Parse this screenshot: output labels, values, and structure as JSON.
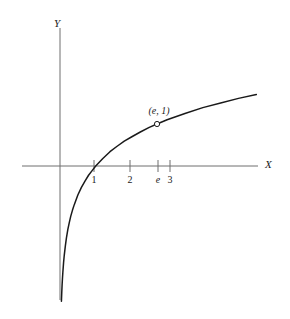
{
  "figure": {
    "background_color": "#ffffff",
    "axis_color": "#6e6e6e",
    "curve_color": "#1a1a1a",
    "text_color": "#1a1a1a"
  },
  "axes": {
    "x_axis_label": "X",
    "y_axis_label": "Y"
  },
  "annotations": {
    "point_label": "(e, 1)",
    "point_marker": "open-circle"
  },
  "ticks": {
    "x": [
      {
        "label": "1",
        "value": 1,
        "italic": false
      },
      {
        "label": "2",
        "value": 2,
        "italic": false
      },
      {
        "label": "e",
        "value": 2.71828,
        "italic": true
      },
      {
        "label": "3",
        "value": 3,
        "italic": false
      }
    ]
  },
  "chart_data": {
    "type": "line",
    "title": "",
    "subtitle": "",
    "xlabel": "X",
    "ylabel": "Y",
    "function": "y = ln(x)",
    "grid": false,
    "legend": false,
    "legend_position": "none",
    "xlim": [
      -1.07,
      5.55
    ],
    "ylim": [
      -3.3,
      2.4
    ],
    "xticks": [
      1,
      2,
      2.71828,
      3
    ],
    "xticklabels": [
      "1",
      "2",
      "e",
      "3"
    ],
    "yticks": [],
    "yticklabels": [],
    "annotations": [
      {
        "text": "(e, 1)",
        "x": 2.71828,
        "y": 1,
        "marker": "open-circle"
      }
    ],
    "series": [
      {
        "name": "y = ln(x)",
        "x": [
          0.04,
          0.05,
          0.06,
          0.07,
          0.08,
          0.1,
          0.12,
          0.15,
          0.18,
          0.22,
          0.26,
          0.3,
          0.35,
          0.4,
          0.5,
          0.6,
          0.7,
          0.8,
          0.9,
          1.0,
          1.2,
          1.4,
          1.6,
          1.8,
          2.0,
          2.25,
          2.5,
          2.71828,
          3.0,
          3.5,
          4.0,
          4.5,
          5.0,
          5.5
        ],
        "y": [
          -3.22,
          -3.0,
          -2.81,
          -2.66,
          -2.53,
          -2.3,
          -2.12,
          -1.9,
          -1.71,
          -1.51,
          -1.35,
          -1.2,
          -1.05,
          -0.92,
          -0.69,
          -0.51,
          -0.36,
          -0.22,
          -0.11,
          0.0,
          0.18,
          0.34,
          0.47,
          0.59,
          0.69,
          0.81,
          0.92,
          1.0,
          1.1,
          1.25,
          1.39,
          1.5,
          1.61,
          1.7
        ]
      }
    ]
  }
}
